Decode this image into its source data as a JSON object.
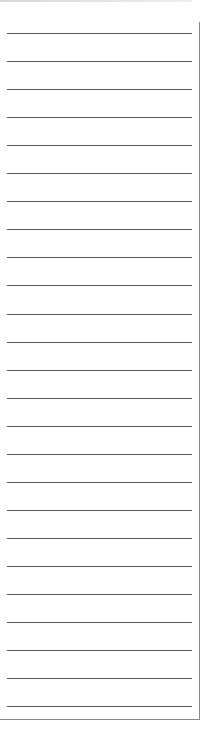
{
  "paper": {
    "type": "lined-note-paper",
    "line_count": 25,
    "first_line_y": 33,
    "line_spacing": 28.05,
    "line_color": "#5a5a5a",
    "border_color": "#8a8a8a",
    "background": "#ffffff"
  }
}
